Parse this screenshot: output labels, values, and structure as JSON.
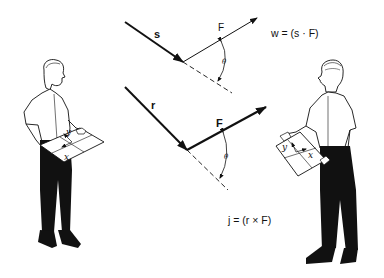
{
  "diagram": {
    "top_panel": {
      "displacement_label": "s",
      "force_label": "F",
      "angle_label": "θ",
      "equation": "w = (s · F)"
    },
    "bottom_panel": {
      "position_label": "r",
      "force_label": "F",
      "angle_label": "θ",
      "equation": "j = (r × F)"
    },
    "left_figure": {
      "description": "man holding a board with axes",
      "axis_labels": {
        "y": "y",
        "x": "x"
      }
    },
    "right_figure": {
      "description": "man holding a board with axes",
      "axis_labels": {
        "y": "y",
        "x": "x"
      }
    },
    "colors": {
      "ink": "#111111",
      "background": "#ffffff"
    }
  }
}
